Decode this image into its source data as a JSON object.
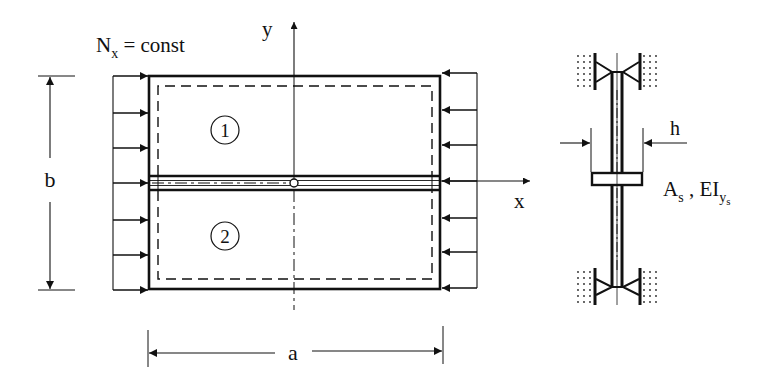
{
  "diagram": {
    "type": "stiffened plate under uniform compression",
    "labels": {
      "load": "N",
      "load_sub": "x",
      "load_rest": " = const",
      "y_axis": "y",
      "x_axis": "x",
      "width_dim": "b",
      "length_dim": "a",
      "panel_1": "1",
      "panel_2": "2",
      "thickness": "h",
      "stiffener_area": "A",
      "stiffener_area_sub": "s",
      "separator": " , ",
      "stiffener_rigidity": "EI",
      "stiffener_rigidity_sub": "y",
      "stiffener_rigidity_subsub": "s"
    },
    "colors": {
      "ink": "#111111",
      "background": "#ffffff"
    }
  }
}
